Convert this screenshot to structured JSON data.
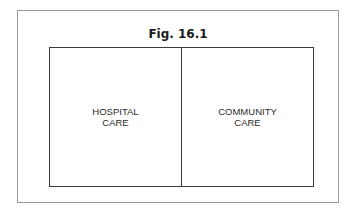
{
  "figure": {
    "title": "Fig. 16.1",
    "cells": [
      {
        "line1": "HOSPITAL",
        "line2": "CARE"
      },
      {
        "line1": "COMMUNITY",
        "line2": "CARE"
      }
    ]
  }
}
